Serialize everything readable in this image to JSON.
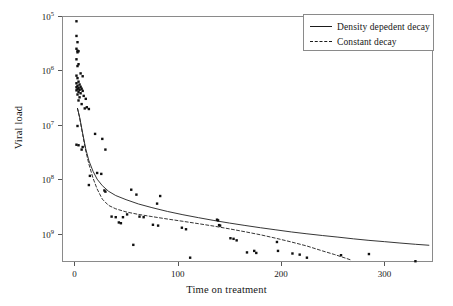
{
  "chart_data": {
    "type": "scatter",
    "title": "",
    "xlabel": "Time on treatment",
    "ylabel": "Viral load",
    "yscale": "log",
    "xlim": [
      -12,
      347
    ],
    "ylim": [
      30000,
      1000000000
    ],
    "grid": false,
    "legend_position": "top-right",
    "xticks": [
      0,
      100,
      200,
      300
    ],
    "xtick_labels": [
      "0",
      "100",
      "200",
      "300"
    ],
    "yticks": [
      100000,
      1000000,
      10000000,
      100000000,
      1000000000
    ],
    "ytick_labels": [
      "10",
      "10",
      "10",
      "10",
      "10"
    ],
    "ytick_exponents": [
      "9",
      "8",
      "7",
      "6",
      "5"
    ],
    "legend": [
      {
        "name": "Density depedent decay",
        "style": "solid",
        "color": "#1b1b1b"
      },
      {
        "name": "Constant decay",
        "style": "dashed",
        "color": "#1b1b1b"
      }
    ],
    "points": [
      [
        2,
        800000000
      ],
      [
        2,
        430000000
      ],
      [
        3,
        330000000
      ],
      [
        2,
        250000000
      ],
      [
        3,
        230000000
      ],
      [
        4,
        225000000
      ],
      [
        3,
        215000000
      ],
      [
        2,
        160000000
      ],
      [
        4,
        130000000
      ],
      [
        3,
        120000000
      ],
      [
        6,
        88000000
      ],
      [
        2,
        80000000
      ],
      [
        8,
        78000000
      ],
      [
        3,
        72000000
      ],
      [
        4,
        62000000
      ],
      [
        2,
        58000000
      ],
      [
        5,
        55000000
      ],
      [
        3,
        52000000
      ],
      [
        6,
        50000000
      ],
      [
        2,
        49000000
      ],
      [
        4,
        47000000
      ],
      [
        7,
        46000000
      ],
      [
        3,
        45000000
      ],
      [
        5,
        44000000
      ],
      [
        2,
        43000000
      ],
      [
        8,
        42000000
      ],
      [
        4,
        40000000
      ],
      [
        6,
        38000000
      ],
      [
        3,
        36000000
      ],
      [
        9,
        34000000
      ],
      [
        5,
        32000000
      ],
      [
        11,
        30000000
      ],
      [
        4,
        28000000
      ],
      [
        7,
        24000000
      ],
      [
        12,
        21000000
      ],
      [
        10,
        20000000
      ],
      [
        14,
        19500000
      ],
      [
        3,
        9500000
      ],
      [
        2,
        4300000
      ],
      [
        4,
        4200000
      ],
      [
        8,
        3900000
      ],
      [
        7,
        3500000
      ],
      [
        20,
        6800000
      ],
      [
        27,
        5500000
      ],
      [
        30,
        3500000
      ],
      [
        22,
        1300000
      ],
      [
        15,
        1150000
      ],
      [
        14,
        780000
      ],
      [
        26,
        1250000
      ],
      [
        29,
        620000
      ],
      [
        30,
        590000
      ],
      [
        55,
        640000
      ],
      [
        60,
        520000
      ],
      [
        83,
        490000
      ],
      [
        80,
        355000
      ],
      [
        36,
        205000
      ],
      [
        40,
        200000
      ],
      [
        47,
        200000
      ],
      [
        51,
        225000
      ],
      [
        43,
        160000
      ],
      [
        45,
        155000
      ],
      [
        63,
        205000
      ],
      [
        67,
        200000
      ],
      [
        76,
        145000
      ],
      [
        81,
        140000
      ],
      [
        104,
        128000
      ],
      [
        108,
        120000
      ],
      [
        138,
        180000
      ],
      [
        139,
        175000
      ],
      [
        140,
        143000
      ],
      [
        141,
        140000
      ],
      [
        151,
        82000
      ],
      [
        154,
        80000
      ],
      [
        157,
        75000
      ],
      [
        167,
        45000
      ],
      [
        174,
        48000
      ],
      [
        176,
        44000
      ],
      [
        196,
        70000
      ],
      [
        197,
        48000
      ],
      [
        211,
        43000
      ],
      [
        218,
        41000
      ],
      [
        225,
        36000
      ],
      [
        258,
        40000
      ],
      [
        285,
        42000
      ],
      [
        330,
        31000
      ],
      [
        57,
        62000
      ],
      [
        112,
        36000
      ],
      [
        20,
        21000
      ]
    ],
    "curves": [
      {
        "name": "Density depedent decay",
        "style": "solid",
        "points": [
          [
            3,
            20000000
          ],
          [
            5,
            14000000
          ],
          [
            8,
            7000000
          ],
          [
            11,
            3600000
          ],
          [
            14,
            2200000
          ],
          [
            18,
            1400000
          ],
          [
            22,
            1000000
          ],
          [
            27,
            760000
          ],
          [
            33,
            600000
          ],
          [
            40,
            500000
          ],
          [
            50,
            420000
          ],
          [
            62,
            350000
          ],
          [
            75,
            300000
          ],
          [
            90,
            255000
          ],
          [
            105,
            222000
          ],
          [
            120,
            196000
          ],
          [
            135,
            174000
          ],
          [
            150,
            156000
          ],
          [
            165,
            141000
          ],
          [
            180,
            128000
          ],
          [
            195,
            117000
          ],
          [
            210,
            107000
          ],
          [
            225,
            99000
          ],
          [
            240,
            92000
          ],
          [
            255,
            86000
          ],
          [
            270,
            80000
          ],
          [
            285,
            75000
          ],
          [
            300,
            71000
          ],
          [
            315,
            67000
          ],
          [
            330,
            63500
          ],
          [
            343,
            61000
          ]
        ]
      },
      {
        "name": "Constant decay",
        "style": "dashed",
        "points": [
          [
            3,
            20000000
          ],
          [
            5,
            13500000
          ],
          [
            8,
            6600000
          ],
          [
            11,
            3300000
          ],
          [
            14,
            1900000
          ],
          [
            18,
            1050000
          ],
          [
            22,
            660000
          ],
          [
            27,
            430000
          ],
          [
            33,
            330000
          ],
          [
            40,
            285000
          ],
          [
            50,
            250000
          ],
          [
            62,
            225000
          ],
          [
            75,
            205000
          ],
          [
            90,
            185000
          ],
          [
            105,
            168000
          ],
          [
            120,
            152000
          ],
          [
            135,
            137000
          ],
          [
            150,
            122000
          ],
          [
            165,
            108000
          ],
          [
            180,
            95000
          ],
          [
            195,
            82000
          ],
          [
            210,
            70000
          ],
          [
            225,
            59000
          ],
          [
            240,
            48000
          ],
          [
            252,
            41000
          ],
          [
            262,
            35500
          ],
          [
            268,
            32500
          ]
        ]
      }
    ]
  }
}
